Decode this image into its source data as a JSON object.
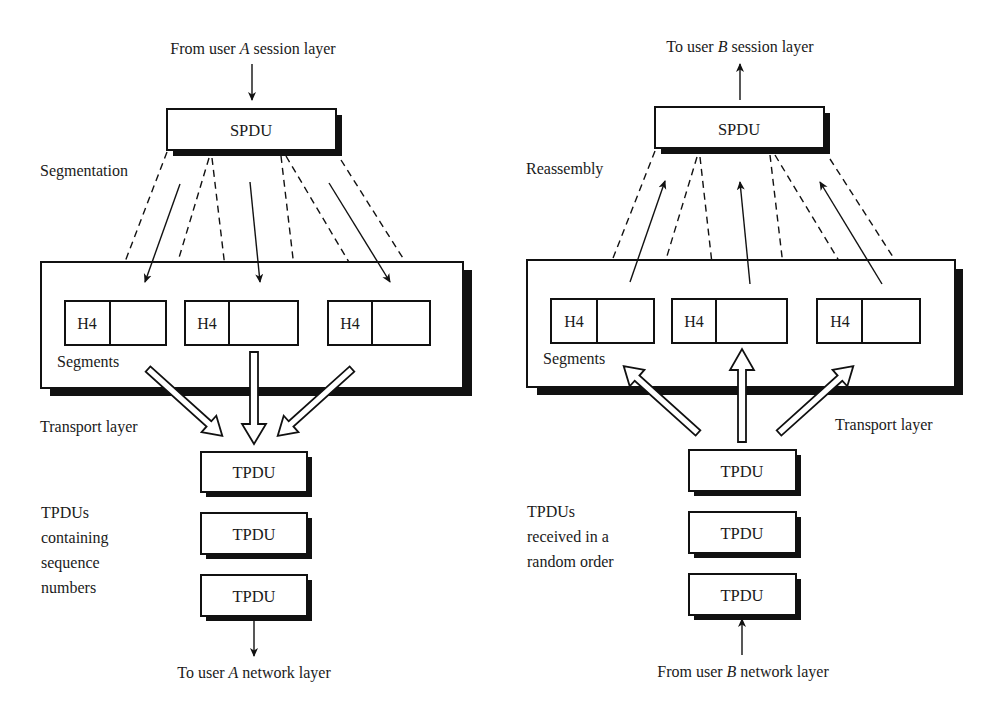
{
  "figure": {
    "left_panel": {
      "title": "Segmentation at sender (user A)",
      "top_label": {
        "prefix": "From user ",
        "user": "A",
        "suffix": " session layer"
      },
      "spdu_label": "SPDU",
      "process_label": "Segmentation",
      "segments": [
        {
          "header": "H4"
        },
        {
          "header": "H4"
        },
        {
          "header": "H4"
        }
      ],
      "segments_label": "Segments",
      "layer_label": "Transport layer",
      "tpdus": [
        "TPDU",
        "TPDU",
        "TPDU"
      ],
      "tpdu_note": [
        "TPDUs",
        "containing",
        "sequence",
        "numbers"
      ],
      "bottom_label": {
        "prefix": "To user ",
        "user": "A",
        "suffix": " network layer"
      }
    },
    "right_panel": {
      "title": "Reassembly at receiver (user B)",
      "top_label": {
        "prefix": "To user ",
        "user": "B",
        "suffix": " session layer"
      },
      "spdu_label": "SPDU",
      "process_label": "Reassembly",
      "segments": [
        {
          "header": "H4"
        },
        {
          "header": "H4"
        },
        {
          "header": "H4"
        }
      ],
      "segments_label": "Segments",
      "layer_label": "Transport layer",
      "tpdus": [
        "TPDU",
        "TPDU",
        "TPDU"
      ],
      "tpdu_note": [
        "TPDUs",
        "received in a",
        "random order"
      ],
      "bottom_label": {
        "prefix": "From user ",
        "user": "B",
        "suffix": " network layer"
      }
    },
    "colors": {
      "ink": "#111111",
      "paper": "#ffffff"
    }
  }
}
